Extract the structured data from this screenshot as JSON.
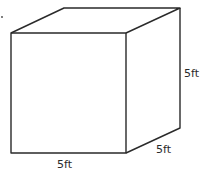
{
  "diagram": {
    "type": "cube",
    "labels": {
      "height": "5ft",
      "depth": "5ft",
      "width": "5ft"
    },
    "stroke_color": "#2a2a2a"
  }
}
